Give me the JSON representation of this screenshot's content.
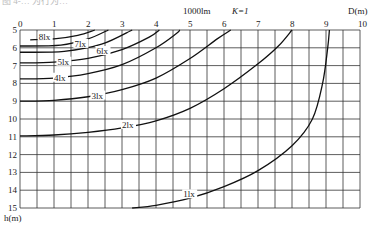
{
  "caption_fragment": "图 4-… 为行为…",
  "chart_data": {
    "type": "line",
    "title": "1000lm  K=1",
    "luminous_flux_label": "1000lm",
    "k_label": "K=1",
    "xlabel": "D(m)",
    "ylabel": "h(m)",
    "xlim": [
      0,
      10
    ],
    "ylim": [
      5,
      15
    ],
    "y_inverted": true,
    "x_axis_position": "top",
    "grid": true,
    "x_grid_step": 0.5,
    "y_grid_step": 1,
    "x_ticks": [
      "0",
      "1",
      "2",
      "3",
      "4",
      "5",
      "6",
      "7",
      "8",
      "9",
      "10"
    ],
    "y_ticks": [
      "5",
      "6",
      "7",
      "8",
      "9",
      "10",
      "11",
      "12",
      "13",
      "14",
      "15"
    ],
    "series": [
      {
        "name": "8lx",
        "points": [
          [
            0.3,
            5.55
          ],
          [
            1.0,
            5.5
          ],
          [
            1.7,
            5.3
          ],
          [
            2.2,
            5.0
          ]
        ]
      },
      {
        "name": "7lx",
        "points": [
          [
            0,
            5.9
          ],
          [
            1.2,
            5.85
          ],
          [
            2.0,
            5.5
          ],
          [
            2.6,
            5.0
          ]
        ]
      },
      {
        "name": "6lx",
        "points": [
          [
            0,
            6.25
          ],
          [
            1.3,
            6.2
          ],
          [
            2.4,
            5.8
          ],
          [
            3.3,
            5.0
          ]
        ]
      },
      {
        "name": "5lx",
        "points": [
          [
            0,
            6.85
          ],
          [
            1.0,
            6.8
          ],
          [
            2.0,
            6.6
          ],
          [
            3.0,
            6.1
          ],
          [
            3.8,
            5.4
          ],
          [
            4.1,
            5.0
          ]
        ]
      },
      {
        "name": "4lx",
        "points": [
          [
            0,
            7.75
          ],
          [
            1.0,
            7.7
          ],
          [
            2.0,
            7.45
          ],
          [
            3.0,
            6.95
          ],
          [
            4.0,
            6.0
          ],
          [
            4.6,
            5.2
          ],
          [
            4.7,
            5.0
          ]
        ]
      },
      {
        "name": "3lx",
        "points": [
          [
            0,
            9.0
          ],
          [
            1.0,
            8.95
          ],
          [
            2.0,
            8.75
          ],
          [
            3.0,
            8.35
          ],
          [
            4.0,
            7.7
          ],
          [
            5.0,
            6.6
          ],
          [
            5.8,
            5.5
          ],
          [
            6.2,
            5.0
          ]
        ]
      },
      {
        "name": "2lx",
        "points": [
          [
            0,
            10.95
          ],
          [
            1.0,
            10.9
          ],
          [
            2.0,
            10.75
          ],
          [
            3.0,
            10.5
          ],
          [
            4.0,
            10.1
          ],
          [
            5.0,
            9.4
          ],
          [
            6.0,
            8.3
          ],
          [
            7.0,
            6.9
          ],
          [
            7.6,
            5.9
          ],
          [
            8.0,
            5.0
          ]
        ]
      },
      {
        "name": "1lx",
        "points": [
          [
            3.3,
            15.0
          ],
          [
            4.0,
            14.85
          ],
          [
            5.0,
            14.45
          ],
          [
            6.0,
            13.8
          ],
          [
            7.0,
            12.9
          ],
          [
            8.0,
            11.5
          ],
          [
            8.6,
            10.0
          ],
          [
            8.9,
            8.0
          ],
          [
            9.05,
            6.0
          ],
          [
            9.1,
            5.0
          ]
        ]
      }
    ],
    "annotations": [
      {
        "text": "8lx",
        "x": 0.55,
        "y": 5.55
      },
      {
        "text": "7lx",
        "x": 1.6,
        "y": 5.95
      },
      {
        "text": "6lx",
        "x": 2.25,
        "y": 6.35
      },
      {
        "text": "5lx",
        "x": 1.1,
        "y": 6.95
      },
      {
        "text": "4lx",
        "x": 1.0,
        "y": 7.85
      },
      {
        "text": "3lx",
        "x": 2.1,
        "y": 8.85
      },
      {
        "text": "2lx",
        "x": 3.0,
        "y": 10.5
      },
      {
        "text": "1lx",
        "x": 4.8,
        "y": 14.4
      }
    ]
  }
}
